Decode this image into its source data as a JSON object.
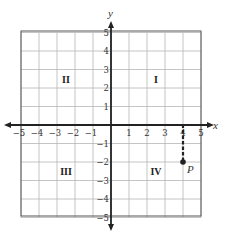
{
  "diagram": {
    "type": "coordinate-plane",
    "x_axis_label": "x",
    "y_axis_label": "y",
    "x_range": [
      -5,
      5
    ],
    "y_range": [
      -5,
      5
    ],
    "x_ticks": [
      {
        "value": -5,
        "label": "−5"
      },
      {
        "value": -4,
        "label": "−4"
      },
      {
        "value": -3,
        "label": "−3"
      },
      {
        "value": -2,
        "label": "−2"
      },
      {
        "value": -1,
        "label": "−1"
      },
      {
        "value": 1,
        "label": "1"
      },
      {
        "value": 2,
        "label": "2"
      },
      {
        "value": 3,
        "label": "3"
      },
      {
        "value": 4,
        "label": "4"
      },
      {
        "value": 5,
        "label": "5"
      }
    ],
    "y_ticks": [
      {
        "value": 5,
        "label": "5"
      },
      {
        "value": 4,
        "label": "4"
      },
      {
        "value": 3,
        "label": "3"
      },
      {
        "value": 2,
        "label": "2"
      },
      {
        "value": 1,
        "label": "1"
      },
      {
        "value": -1,
        "label": "−1"
      },
      {
        "value": -2,
        "label": "−2"
      },
      {
        "value": -3,
        "label": "−3"
      },
      {
        "value": -4,
        "label": "−4"
      },
      {
        "value": -5,
        "label": "−5"
      }
    ],
    "quadrants": [
      {
        "label": "I",
        "x": 2.5,
        "y": 2.5
      },
      {
        "label": "II",
        "x": -2.5,
        "y": 2.5
      },
      {
        "label": "III",
        "x": -2.5,
        "y": -2.5
      },
      {
        "label": "IV",
        "x": 2.5,
        "y": -2.5
      }
    ],
    "point": {
      "label": "P",
      "x": 4,
      "y": -2
    },
    "dashed_path": [
      [
        0,
        0
      ],
      [
        4,
        0
      ],
      [
        4,
        -2
      ]
    ],
    "colors": {
      "grid": "#b5b5b5",
      "border": "#555555",
      "axis": "#222222",
      "dashed": "#222222",
      "point": "#222222"
    }
  }
}
